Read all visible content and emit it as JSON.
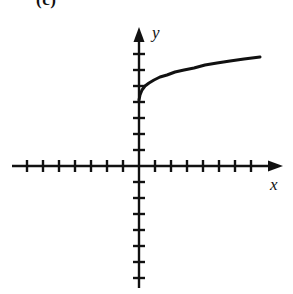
{
  "figure": {
    "part_label": "(c)",
    "background_color": "#ffffff",
    "ink_color": "#111111"
  },
  "chart_data": {
    "type": "line",
    "title": "",
    "subtitle": "",
    "xlabel": "x",
    "ylabel": "y",
    "grid": false,
    "legend": null,
    "annotations": [],
    "axes": {
      "origin_px": [
        139,
        166
      ],
      "tick_spacing_px": 16,
      "xlim": [
        -8,
        9
      ],
      "ylim": [
        -8,
        9
      ],
      "x_axis_px": {
        "start": 12,
        "end": 283,
        "y": 166,
        "arrow": "right"
      },
      "y_axis_px": {
        "start": 288,
        "end": 27,
        "x": 139,
        "arrow": "up"
      },
      "x_ticks_negative_count": 7,
      "x_ticks_positive_count": 7,
      "y_ticks_negative_count": 7,
      "y_ticks_positive_count": 7,
      "tick_half_length_px": 5,
      "tick_labels_shown": false
    },
    "series": [
      {
        "name": "curve",
        "description": "increasing concave-down root-type curve starting on the y-axis",
        "domain_units": [
          0,
          7.5
        ],
        "y_intercept_units": 4.1,
        "end_point_units": [
          7.5,
          6.8
        ],
        "points_px": [
          [
            139,
            100
          ],
          [
            140,
            95
          ],
          [
            142,
            90
          ],
          [
            145,
            86
          ],
          [
            149,
            83
          ],
          [
            154,
            80
          ],
          [
            160,
            77
          ],
          [
            167,
            75
          ],
          [
            175,
            72
          ],
          [
            184,
            70
          ],
          [
            194,
            68
          ],
          [
            205,
            65
          ],
          [
            217,
            63
          ],
          [
            230,
            61
          ],
          [
            244,
            59
          ],
          [
            260,
            57
          ]
        ]
      }
    ]
  }
}
